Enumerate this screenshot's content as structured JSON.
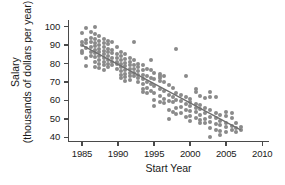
{
  "chart_data": {
    "type": "scatter",
    "title": "",
    "xlabel": "Start Year",
    "ylabel_line1": "Salary",
    "ylabel_line2": "(thousands of dollars per year)",
    "ylabel": "Salary (thousands of dollars per year)",
    "xlim": [
      1983.2,
      2010.8
    ],
    "ylim": [
      38.0,
      102.5
    ],
    "xticks": [
      1985,
      1990,
      1995,
      2000,
      2005,
      2010
    ],
    "xtick_labels": [
      "1985",
      "1990",
      "1995",
      "2000",
      "2005",
      "2010"
    ],
    "yticks": [
      40,
      50,
      60,
      70,
      80,
      90,
      100
    ],
    "ytick_labels": [
      "40",
      "50",
      "60",
      "70",
      "80",
      "90",
      "100"
    ],
    "grid": false,
    "legend": false,
    "marker_color": "#8a8a8a",
    "line_color": "#6e6e6e",
    "axis_color": "#4a4a4a",
    "trend_line": {
      "type": "linear-fit",
      "x_start": 1985.0,
      "y_start": 90.0,
      "x_end": 2007.0,
      "y_end": 44.0,
      "slope": -2.09,
      "intercept": 4242.6
    },
    "points": [
      [
        1985.0,
        96.5
      ],
      [
        1985.0,
        91.5
      ],
      [
        1985.0,
        90.0
      ],
      [
        1985.0,
        87.0
      ],
      [
        1985.0,
        85.5
      ],
      [
        1985.6,
        99.0
      ],
      [
        1985.6,
        93.0
      ],
      [
        1985.6,
        91.0
      ],
      [
        1985.6,
        88.5
      ],
      [
        1985.6,
        83.0
      ],
      [
        1985.6,
        78.5
      ],
      [
        1986.2,
        97.0
      ],
      [
        1986.2,
        94.0
      ],
      [
        1986.2,
        91.5
      ],
      [
        1986.2,
        89.0
      ],
      [
        1986.2,
        86.5
      ],
      [
        1986.2,
        84.0
      ],
      [
        1986.8,
        100.0
      ],
      [
        1986.8,
        96.0
      ],
      [
        1986.8,
        93.5
      ],
      [
        1986.8,
        91.0
      ],
      [
        1986.8,
        89.5
      ],
      [
        1986.8,
        87.5
      ],
      [
        1986.8,
        85.5
      ],
      [
        1986.8,
        83.5
      ],
      [
        1986.8,
        81.0
      ],
      [
        1986.8,
        78.0
      ],
      [
        1987.4,
        95.0
      ],
      [
        1987.4,
        92.0
      ],
      [
        1987.4,
        90.0
      ],
      [
        1987.4,
        88.0
      ],
      [
        1987.4,
        86.0
      ],
      [
        1987.4,
        84.0
      ],
      [
        1987.4,
        82.0
      ],
      [
        1987.4,
        80.0
      ],
      [
        1987.4,
        77.5
      ],
      [
        1988.0,
        93.5
      ],
      [
        1988.0,
        91.0
      ],
      [
        1988.0,
        89.0
      ],
      [
        1988.0,
        87.0
      ],
      [
        1988.0,
        85.0
      ],
      [
        1988.0,
        83.0
      ],
      [
        1988.0,
        81.0
      ],
      [
        1988.0,
        79.0
      ],
      [
        1988.0,
        76.5
      ],
      [
        1988.6,
        92.0
      ],
      [
        1988.6,
        90.5
      ],
      [
        1988.6,
        88.0
      ],
      [
        1988.6,
        86.0
      ],
      [
        1988.6,
        84.0
      ],
      [
        1988.6,
        82.0
      ],
      [
        1988.6,
        80.0
      ],
      [
        1988.6,
        78.0
      ],
      [
        1989.2,
        91.5
      ],
      [
        1989.2,
        87.5
      ],
      [
        1989.2,
        85.5
      ],
      [
        1989.2,
        83.0
      ],
      [
        1989.2,
        81.0
      ],
      [
        1989.2,
        79.0
      ],
      [
        1989.8,
        89.0
      ],
      [
        1989.8,
        85.0
      ],
      [
        1989.8,
        83.0
      ],
      [
        1989.8,
        81.0
      ],
      [
        1989.8,
        79.5
      ],
      [
        1989.8,
        77.0
      ],
      [
        1990.4,
        86.0
      ],
      [
        1990.4,
        84.0
      ],
      [
        1990.4,
        82.0
      ],
      [
        1990.4,
        80.0
      ],
      [
        1990.4,
        78.0
      ],
      [
        1990.4,
        76.0
      ],
      [
        1990.4,
        74.0
      ],
      [
        1990.4,
        72.0
      ],
      [
        1991.0,
        85.0
      ],
      [
        1991.0,
        82.5
      ],
      [
        1991.0,
        80.5
      ],
      [
        1991.0,
        78.5
      ],
      [
        1991.0,
        76.5
      ],
      [
        1991.0,
        74.5
      ],
      [
        1991.0,
        72.5
      ],
      [
        1991.0,
        70.5
      ],
      [
        1991.6,
        83.0
      ],
      [
        1991.6,
        81.0
      ],
      [
        1991.6,
        79.0
      ],
      [
        1991.6,
        77.0
      ],
      [
        1991.6,
        75.0
      ],
      [
        1991.6,
        73.0
      ],
      [
        1991.6,
        71.0
      ],
      [
        1992.2,
        91.5
      ],
      [
        1992.2,
        82.0
      ],
      [
        1992.2,
        79.0
      ],
      [
        1992.2,
        77.0
      ],
      [
        1992.2,
        75.0
      ],
      [
        1992.2,
        73.0
      ],
      [
        1992.8,
        80.0
      ],
      [
        1992.8,
        78.0
      ],
      [
        1992.8,
        76.0
      ],
      [
        1992.8,
        74.0
      ],
      [
        1992.8,
        72.0
      ],
      [
        1992.8,
        70.0
      ],
      [
        1993.4,
        79.0
      ],
      [
        1993.4,
        76.5
      ],
      [
        1993.4,
        74.0
      ],
      [
        1993.4,
        71.5
      ],
      [
        1993.4,
        69.0
      ],
      [
        1993.4,
        66.0
      ],
      [
        1993.4,
        64.5
      ],
      [
        1994.0,
        77.0
      ],
      [
        1994.0,
        73.0
      ],
      [
        1994.0,
        70.0
      ],
      [
        1994.0,
        66.5
      ],
      [
        1994.0,
        64.0
      ],
      [
        1994.6,
        82.0
      ],
      [
        1994.6,
        76.5
      ],
      [
        1994.6,
        72.0
      ],
      [
        1994.6,
        69.0
      ],
      [
        1994.6,
        65.0
      ],
      [
        1995.0,
        75.0
      ],
      [
        1995.0,
        71.5
      ],
      [
        1995.0,
        68.0
      ],
      [
        1995.0,
        64.0
      ],
      [
        1995.0,
        60.0
      ],
      [
        1995.0,
        57.0
      ],
      [
        1995.8,
        74.5
      ],
      [
        1995.8,
        73.5
      ],
      [
        1995.8,
        72.0
      ],
      [
        1995.8,
        70.5
      ],
      [
        1995.8,
        66.0
      ],
      [
        1995.8,
        62.5
      ],
      [
        1995.8,
        59.0
      ],
      [
        1996.4,
        73.0
      ],
      [
        1996.4,
        70.0
      ],
      [
        1996.4,
        65.0
      ],
      [
        1996.4,
        61.0
      ],
      [
        1996.4,
        58.5
      ],
      [
        1997.0,
        68.5
      ],
      [
        1997.0,
        63.0
      ],
      [
        1997.0,
        59.5
      ],
      [
        1997.0,
        55.0
      ],
      [
        1997.0,
        50.0
      ],
      [
        1997.6,
        66.5
      ],
      [
        1997.6,
        62.0
      ],
      [
        1997.6,
        59.0
      ],
      [
        1997.6,
        53.5
      ],
      [
        1998.0,
        88.0
      ],
      [
        1998.0,
        64.0
      ],
      [
        1998.0,
        60.0
      ],
      [
        1998.0,
        56.0
      ],
      [
        1998.0,
        52.5
      ],
      [
        1998.8,
        63.0
      ],
      [
        1998.8,
        59.5
      ],
      [
        1998.8,
        56.5
      ],
      [
        1998.8,
        53.0
      ],
      [
        1999.4,
        73.0
      ],
      [
        1999.4,
        62.0
      ],
      [
        1999.4,
        58.0
      ],
      [
        1999.4,
        55.0
      ],
      [
        1999.4,
        51.0
      ],
      [
        2000.0,
        61.0
      ],
      [
        2000.0,
        59.0
      ],
      [
        2000.0,
        57.0
      ],
      [
        2000.0,
        54.0
      ],
      [
        2000.0,
        51.5
      ],
      [
        2000.0,
        49.0
      ],
      [
        2000.8,
        66.0
      ],
      [
        2000.8,
        64.5
      ],
      [
        2000.8,
        58.0
      ],
      [
        2000.8,
        56.0
      ],
      [
        2000.8,
        53.5
      ],
      [
        2000.8,
        50.5
      ],
      [
        2001.4,
        62.5
      ],
      [
        2001.4,
        57.5
      ],
      [
        2001.4,
        55.5
      ],
      [
        2001.4,
        52.0
      ],
      [
        2001.4,
        49.5
      ],
      [
        2001.4,
        47.5
      ],
      [
        2002.0,
        61.5
      ],
      [
        2002.0,
        56.0
      ],
      [
        2002.0,
        53.0
      ],
      [
        2002.0,
        50.0
      ],
      [
        2002.0,
        48.0
      ],
      [
        2002.8,
        64.5
      ],
      [
        2002.8,
        62.0
      ],
      [
        2002.8,
        55.0
      ],
      [
        2002.8,
        51.0
      ],
      [
        2002.8,
        48.5
      ],
      [
        2002.8,
        45.0
      ],
      [
        2002.8,
        40.0
      ],
      [
        2003.6,
        62.0
      ],
      [
        2003.6,
        53.0
      ],
      [
        2003.6,
        50.5
      ],
      [
        2003.6,
        47.0
      ],
      [
        2003.6,
        44.0
      ],
      [
        2004.2,
        52.0
      ],
      [
        2004.2,
        49.0
      ],
      [
        2004.2,
        46.5
      ],
      [
        2004.2,
        43.5
      ],
      [
        2004.2,
        41.5
      ],
      [
        2005.0,
        53.5
      ],
      [
        2005.0,
        51.5
      ],
      [
        2005.0,
        48.0
      ],
      [
        2005.0,
        45.5
      ],
      [
        2005.0,
        43.0
      ],
      [
        2005.8,
        53.0
      ],
      [
        2005.8,
        50.5
      ],
      [
        2005.8,
        46.0
      ],
      [
        2005.8,
        44.0
      ],
      [
        2006.4,
        47.5
      ],
      [
        2006.4,
        45.0
      ],
      [
        2006.4,
        43.0
      ],
      [
        2007.0,
        45.5
      ],
      [
        2007.0,
        44.0
      ]
    ]
  }
}
